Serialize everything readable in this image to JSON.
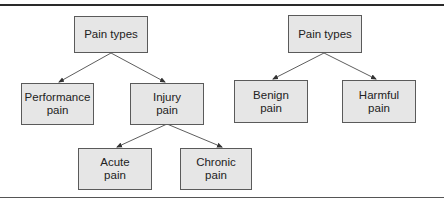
{
  "diagram": {
    "type": "tree",
    "trees": [
      {
        "id": "tree-left",
        "root": {
          "id": "pain-types-left",
          "label": "Pain types"
        },
        "children": [
          {
            "id": "performance-pain",
            "label": "Performance\npain"
          },
          {
            "id": "injury-pain",
            "label": "Injury\npain",
            "children": [
              {
                "id": "acute-pain",
                "label": "Acute\npain"
              },
              {
                "id": "chronic-pain",
                "label": "Chronic\npain"
              }
            ]
          }
        ]
      },
      {
        "id": "tree-right",
        "root": {
          "id": "pain-types-right",
          "label": "Pain types"
        },
        "children": [
          {
            "id": "benign-pain",
            "label": "Benign\npain"
          },
          {
            "id": "harmful-pain",
            "label": "Harmful\npain"
          }
        ]
      }
    ],
    "edges": [
      {
        "from": "pain-types-left",
        "to": "performance-pain"
      },
      {
        "from": "pain-types-left",
        "to": "injury-pain"
      },
      {
        "from": "injury-pain",
        "to": "acute-pain"
      },
      {
        "from": "injury-pain",
        "to": "chronic-pain"
      },
      {
        "from": "pain-types-right",
        "to": "benign-pain"
      },
      {
        "from": "pain-types-right",
        "to": "harmful-pain"
      }
    ]
  },
  "labels": {
    "left_root": "Pain types",
    "performance": "Performance\npain",
    "injury": "Injury\npain",
    "acute": "Acute\npain",
    "chronic": "Chronic\npain",
    "right_root": "Pain types",
    "benign": "Benign\npain",
    "harmful": "Harmful\npain"
  },
  "colors": {
    "node_fill": "#e6e6e6",
    "node_border": "#5a5a5a",
    "edge": "#333333",
    "rule": "#2a2a2a"
  }
}
